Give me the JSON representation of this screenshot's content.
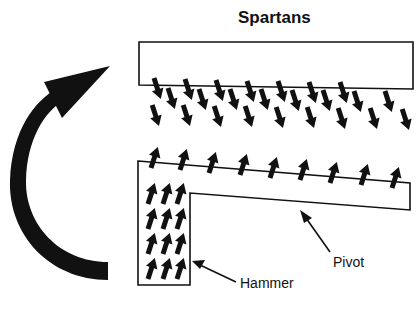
{
  "diagram": {
    "title": "Spartans",
    "labels": {
      "pivot": "Pivot",
      "hammer": "Hammer"
    },
    "icons": {
      "rotation": "curved-arrow-icon",
      "spin_down": "down-arrow-icon",
      "spin_up": "up-arrow-icon",
      "pointer": "pointer-arrow-icon"
    },
    "colors": {
      "ink": "#111111",
      "background": "#ffffff"
    },
    "top_bar_arrow_count": 15,
    "pivot_top_arrow_count": 9,
    "hammer_arrow_rows": 4,
    "hammer_arrow_cols": 3
  }
}
